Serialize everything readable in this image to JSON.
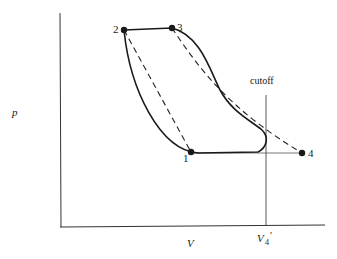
{
  "diagram": {
    "type": "pV-diagram",
    "axes": {
      "y_label": "p",
      "x_label": "V",
      "x_marker_label": "V",
      "x_marker_subscript": "4",
      "x_marker_prime": "′"
    },
    "cutoff_label": "cutoff",
    "points": [
      {
        "id": "1",
        "label": "1"
      },
      {
        "id": "2",
        "label": "2"
      },
      {
        "id": "3",
        "label": "3"
      },
      {
        "id": "4",
        "label": "4"
      }
    ],
    "colors": {
      "ink": "#1a1a1a",
      "thin": "#555555",
      "background": "#ffffff"
    }
  }
}
